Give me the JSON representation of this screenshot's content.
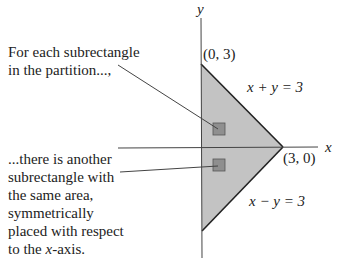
{
  "axes": {
    "x_label": "x",
    "y_label": "y"
  },
  "points": {
    "top": "(0, 3)",
    "right": "(3, 0)"
  },
  "lines": {
    "upper": "x + y = 3",
    "lower": "x − y = 3"
  },
  "annotations": {
    "top": [
      "For each subrectangle",
      "in the partition...,"
    ],
    "bottom": [
      "...there is another",
      "subrectangle with",
      "the same area,",
      "symmetrically",
      "placed with respect",
      "to the ",
      "x",
      "-axis."
    ]
  },
  "colors": {
    "fill": "#c3c3c3",
    "square": "#8f8f8f",
    "line": "#222222"
  }
}
